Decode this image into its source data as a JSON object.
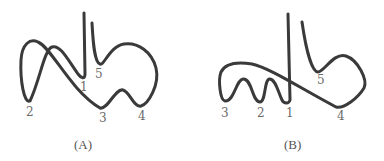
{
  "figure": {
    "panels": [
      {
        "id": "A",
        "caption": "(A)",
        "points": [
          {
            "label": "1",
            "x": 84,
            "y": 91
          },
          {
            "label": "2",
            "x": 29,
            "y": 116
          },
          {
            "label": "3",
            "x": 102,
            "y": 122
          },
          {
            "label": "4",
            "x": 141,
            "y": 120
          },
          {
            "label": "5",
            "x": 98,
            "y": 78
          }
        ]
      },
      {
        "id": "B",
        "caption": "(B)",
        "points": [
          {
            "label": "1",
            "x": 289,
            "y": 117
          },
          {
            "label": "2",
            "x": 260,
            "y": 117
          },
          {
            "label": "3",
            "x": 224,
            "y": 117
          },
          {
            "label": "4",
            "x": 340,
            "y": 120
          },
          {
            "label": "5",
            "x": 320,
            "y": 84
          }
        ]
      }
    ],
    "stroke_color": "#3a3a3a",
    "label_color": "#6b6b6b"
  }
}
